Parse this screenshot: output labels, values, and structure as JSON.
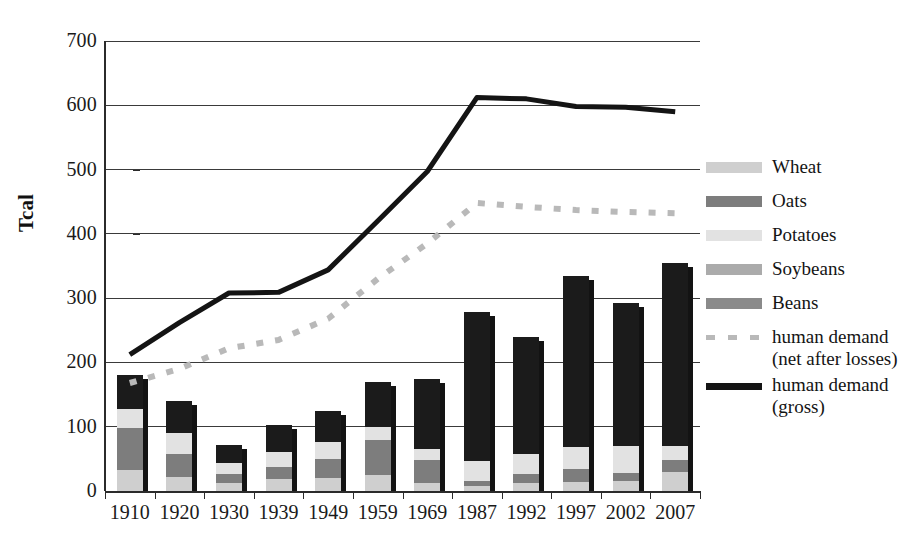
{
  "chart_data": {
    "type": "bar",
    "title": "",
    "xlabel": "",
    "ylabel": "Tcal",
    "ylim": [
      0,
      700
    ],
    "ytick_step": 100,
    "yticks": [
      "700",
      "600",
      "500",
      "400",
      "300",
      "200",
      "100",
      "0"
    ],
    "grid": true,
    "legend_position": "right",
    "categories": [
      "1910",
      "1920",
      "1930",
      "1939",
      "1949",
      "1959",
      "1969",
      "1987",
      "1992",
      "1997",
      "2002",
      "2007"
    ],
    "stacked_series": [
      {
        "name": "Wheat",
        "color": "#cfcfcf",
        "values": [
          32,
          22,
          12,
          18,
          20,
          25,
          12,
          8,
          12,
          14,
          16,
          30
        ]
      },
      {
        "name": "Oats",
        "color": "#7d7d7d",
        "values": [
          66,
          36,
          14,
          20,
          30,
          55,
          36,
          8,
          14,
          20,
          12,
          18
        ]
      },
      {
        "name": "Potatoes",
        "color": "#e2e2e2",
        "values": [
          30,
          32,
          18,
          22,
          26,
          20,
          18,
          30,
          32,
          34,
          42,
          22
        ]
      },
      {
        "name": "Soybeans",
        "color": "#ababab",
        "values": [
          0,
          0,
          0,
          0,
          0,
          0,
          0,
          0,
          0,
          0,
          0,
          0
        ]
      },
      {
        "name": "Beans",
        "color": "#1b1b1b",
        "values": [
          52,
          50,
          27,
          43,
          49,
          69,
          108,
          232,
          181,
          267,
          222,
          285
        ]
      }
    ],
    "bar_totals": [
      180,
      140,
      71,
      103,
      125,
      169,
      174,
      278,
      239,
      335,
      292,
      355
    ],
    "line_series": [
      {
        "name": "human demand (net after losses)",
        "style": "dashed",
        "color": "#b9b9b9",
        "values": [
          168,
          190,
          222,
          235,
          268,
          330,
          385,
          448,
          442,
          437,
          434,
          432
        ]
      },
      {
        "name": "human demand (gross)",
        "style": "solid",
        "color": "#141414",
        "values": [
          212,
          262,
          308,
          309,
          344,
          420,
          497,
          612,
          610,
          598,
          597,
          590
        ]
      }
    ]
  },
  "axis": {
    "y_label": "Tcal"
  },
  "legend": {
    "entries": [
      {
        "label": "Wheat",
        "swatch": "wheat-swatch",
        "kind": "block",
        "color": "#cfcfcf"
      },
      {
        "label": "Oats",
        "swatch": "oats-swatch",
        "kind": "block",
        "color": "#7d7d7d"
      },
      {
        "label": "Potatoes",
        "swatch": "potatoes-swatch",
        "kind": "block",
        "color": "#e2e2e2"
      },
      {
        "label": "Soybeans",
        "swatch": "soybeans-swatch",
        "kind": "block",
        "color": "#ababab"
      },
      {
        "label": "Beans",
        "swatch": "beans-swatch",
        "kind": "block",
        "color": "#8a8a8a"
      },
      {
        "label": "human demand\n(net after losses)",
        "swatch": "dashed-line-swatch",
        "kind": "dash",
        "color": "#b9b9b9"
      },
      {
        "label": "human demand\n(gross)",
        "swatch": "solid-line-swatch",
        "kind": "solid",
        "color": "#141414"
      }
    ]
  }
}
